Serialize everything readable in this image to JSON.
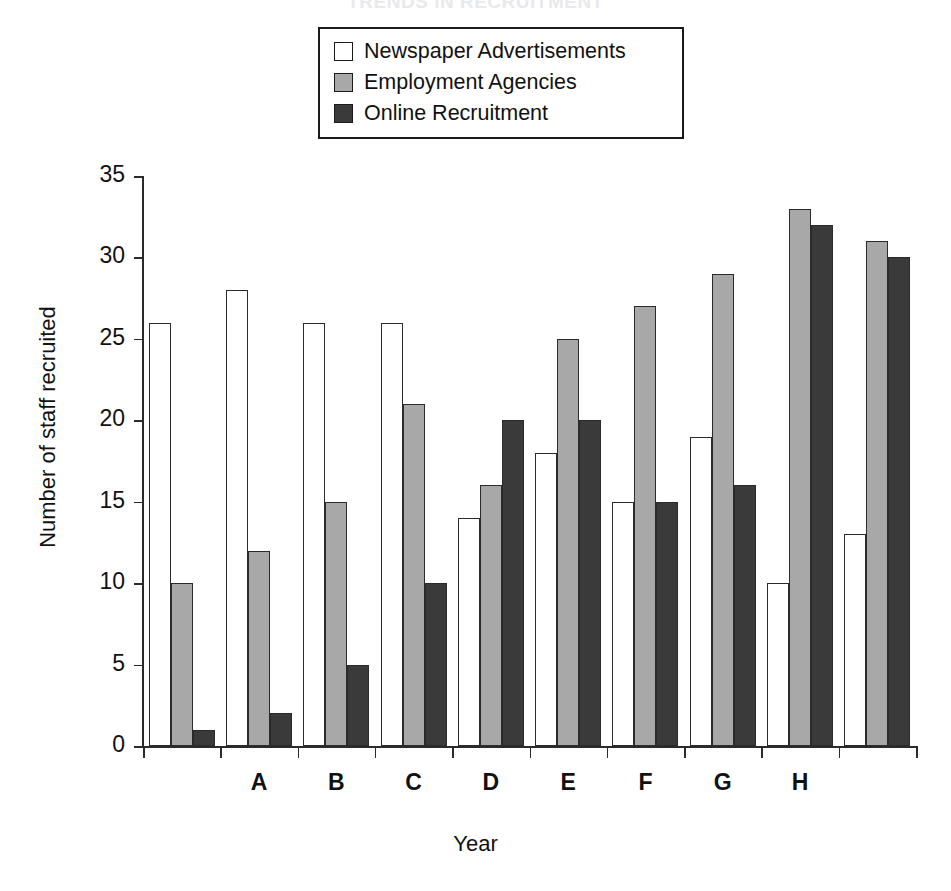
{
  "chart_title": "TRENDS IN RECRUITMENT",
  "legend": {
    "position": "top-center",
    "entries": [
      {
        "label": "Newspaper Advertisements",
        "color": "#ffffff",
        "border": "#1a1a1a"
      },
      {
        "label": "Employment Agencies",
        "color": "#a8a8a8",
        "border": "#1a1a1a"
      },
      {
        "label": "Online Recruitment",
        "color": "#3a3a3a",
        "border": "#1a1a1a"
      }
    ]
  },
  "chart_data": {
    "type": "bar",
    "title": "TRENDS IN RECRUITMENT",
    "xlabel": "Year",
    "ylabel": "Number of staff recruited",
    "ylim": [
      0,
      35
    ],
    "ytick_step": 5,
    "yticks": [
      0,
      5,
      10,
      15,
      20,
      25,
      30,
      35
    ],
    "grid": false,
    "legend_position": "top-center",
    "categories": [
      "",
      "A",
      "B",
      "C",
      "D",
      "E",
      "F",
      "G",
      "H",
      ""
    ],
    "tick_labels": [
      "A",
      "B",
      "C",
      "D",
      "E",
      "F",
      "G",
      "H"
    ],
    "series": [
      {
        "name": "Newspaper Advertisements",
        "color": "#ffffff",
        "values": [
          26,
          28,
          26,
          26,
          14,
          18,
          15,
          19,
          10,
          13
        ]
      },
      {
        "name": "Employment Agencies",
        "color": "#a8a8a8",
        "values": [
          10,
          12,
          15,
          21,
          16,
          25,
          27,
          29,
          33,
          31
        ]
      },
      {
        "name": "Online Recruitment",
        "color": "#3a3a3a",
        "values": [
          1,
          2,
          5,
          10,
          20,
          20,
          15,
          16,
          32,
          30
        ]
      }
    ]
  },
  "axes": {
    "y_title": "Number of staff recruited",
    "x_title": "Year"
  }
}
